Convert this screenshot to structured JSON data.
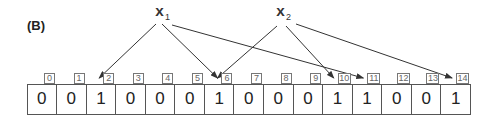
{
  "panel_label": "(B)",
  "elements": [
    {
      "id": "x1",
      "name": "x",
      "subscript": "1",
      "targets": [
        2,
        6,
        11
      ]
    },
    {
      "id": "x2",
      "name": "x",
      "subscript": "2",
      "targets": [
        6,
        10,
        14
      ]
    }
  ],
  "bit_array": {
    "indices": [
      "0",
      "1",
      "2",
      "3",
      "4",
      "5",
      "6",
      "7",
      "8",
      "9",
      "10",
      "11",
      "12",
      "13",
      "14"
    ],
    "bits": [
      0,
      0,
      1,
      0,
      0,
      0,
      1,
      0,
      0,
      0,
      1,
      1,
      0,
      0,
      1
    ]
  },
  "colors": {
    "line": "#333333",
    "cell_border": "#555555",
    "index_border": "#777777",
    "index_text": "#666666"
  }
}
